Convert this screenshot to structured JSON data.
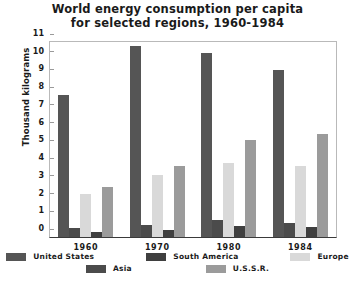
{
  "chart_data": {
    "type": "bar",
    "title": "World energy consumption per capita for selected regions, 1960-1984",
    "title_line1": "World energy consumption per capita",
    "title_line2": "for selected regions, 1960-1984",
    "xlabel": "",
    "ylabel": "Thousand kilograms",
    "ylim": [
      0,
      11
    ],
    "yticks": [
      0,
      1,
      2,
      3,
      4,
      5,
      6,
      7,
      8,
      9,
      10,
      11
    ],
    "ytick_labels": [
      "0",
      "1",
      "2",
      "3",
      "4",
      "5",
      "6",
      "7",
      "8",
      "9",
      "10",
      "11"
    ],
    "grid": false,
    "legend_position": "bottom",
    "categories": [
      "1960",
      "1970",
      "1980",
      "1984"
    ],
    "series": [
      {
        "name": "United States",
        "color": "#555555",
        "values": [
          8.0,
          10.8,
          10.4,
          9.4
        ]
      },
      {
        "name": "Asia",
        "color": "#4b4b4b",
        "values": [
          0.5,
          0.7,
          0.95,
          0.8
        ]
      },
      {
        "name": "Europe",
        "color": "#d9d9d9",
        "values": [
          2.4,
          3.5,
          4.2,
          4.0
        ]
      },
      {
        "name": "South America",
        "color": "#3f3f3f",
        "values": [
          0.3,
          0.4,
          0.6,
          0.55
        ]
      },
      {
        "name": "U.S.S.R.",
        "color": "#9b9b9b",
        "values": [
          2.8,
          4.0,
          5.5,
          5.8
        ]
      }
    ]
  },
  "legend": {
    "row1": [
      "United States",
      "South America",
      "Europe"
    ],
    "row2": [
      "Asia",
      "U.S.S.R."
    ]
  }
}
